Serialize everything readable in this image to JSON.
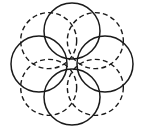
{
  "figure": {
    "title": "Rosette of eight overlapping circles",
    "background_color": "#ffffff",
    "stroke_color": "#1a1a1a",
    "canvas": {
      "width": 145,
      "height": 131
    },
    "geometry": {
      "center_x": 72,
      "center_y": 64,
      "ring_radius": 33,
      "circle_radius": 28,
      "circle_count": 8,
      "start_angle_deg": -90,
      "angle_step_deg": 45
    },
    "styles": {
      "solid": {
        "name": "solid",
        "stroke_width": 1.5,
        "dash_pattern": "none"
      },
      "dashed": {
        "name": "dashed",
        "stroke_width": 1.4,
        "dash_pattern": "5 3.2"
      }
    },
    "circles": [
      {
        "label": "circle-top",
        "position": "top",
        "angle_deg": -90,
        "cx": 72,
        "cy": 31,
        "r": 28,
        "style": "solid"
      },
      {
        "label": "circle-top-right",
        "position": "top-right",
        "angle_deg": -45,
        "cx": 95.33,
        "cy": 40.66,
        "r": 28,
        "style": "dashed"
      },
      {
        "label": "circle-right",
        "position": "right",
        "angle_deg": 0,
        "cx": 105,
        "cy": 64,
        "r": 28,
        "style": "solid"
      },
      {
        "label": "circle-bottom-right",
        "position": "bottom-right",
        "angle_deg": 45,
        "cx": 95.33,
        "cy": 87.33,
        "r": 28,
        "style": "dashed"
      },
      {
        "label": "circle-bottom",
        "position": "bottom",
        "angle_deg": 90,
        "cx": 72,
        "cy": 97,
        "r": 28,
        "style": "solid"
      },
      {
        "label": "circle-bottom-left",
        "position": "bottom-left",
        "angle_deg": 135,
        "cx": 48.66,
        "cy": 87.33,
        "r": 28,
        "style": "dashed"
      },
      {
        "label": "circle-left",
        "position": "left",
        "angle_deg": 180,
        "cx": 39,
        "cy": 64,
        "r": 28,
        "style": "solid"
      },
      {
        "label": "circle-top-left",
        "position": "top-left",
        "angle_deg": -135,
        "cx": 48.66,
        "cy": 40.66,
        "r": 28,
        "style": "dashed"
      }
    ]
  }
}
